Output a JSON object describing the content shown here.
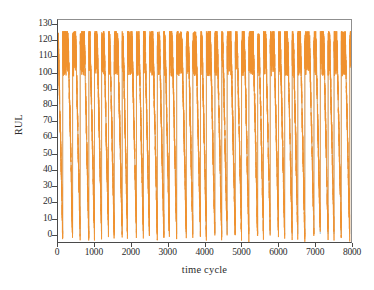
{
  "chart_data": {
    "type": "line",
    "title": "",
    "xlabel": "time cycle",
    "ylabel": "RUL",
    "xlim": [
      0,
      8000
    ],
    "ylim": [
      -5,
      133
    ],
    "xticks": [
      0,
      1000,
      2000,
      3000,
      4000,
      5000,
      6000,
      7000,
      8000
    ],
    "xtick_labels": [
      "0",
      "1000",
      "2000",
      "3000",
      "4000",
      "5000",
      "6000",
      "7000",
      "8000"
    ],
    "yticks": [
      0,
      10,
      20,
      30,
      40,
      50,
      60,
      70,
      80,
      90,
      100,
      110,
      120,
      130
    ],
    "ytick_labels": [
      "0",
      "10",
      "20",
      "30",
      "40",
      "50",
      "60",
      "70",
      "80",
      "90",
      "100",
      "110",
      "120",
      "130"
    ],
    "grid": false,
    "legend": "none",
    "series": [
      {
        "name": "true RUL",
        "color": "#aecde3",
        "linewidth": 0.9,
        "description": "Piecewise-linear ground-truth RUL: clipped at a ceiling of 120 then ramping linearly down to 0 at each engine end-of-life, repeating as a sawtooth across 8000 time cycles.",
        "cap_value": 120,
        "floor_value": 0,
        "cycle_count": 100,
        "segment_lengths": [
          128,
          269,
          206,
          235,
          154,
          193,
          188,
          156,
          216,
          144,
          243,
          189,
          164,
          214,
          178,
          150,
          197,
          263,
          176,
          208,
          160,
          232,
          185,
          147,
          221,
          170,
          199,
          239,
          158,
          183,
          226,
          167,
          204,
          152,
          191,
          248,
          173,
          212,
          161,
          196,
          230,
          149,
          187,
          218,
          165,
          202,
          256,
          179,
          223,
          155,
          194,
          237,
          171,
          209,
          163,
          190,
          244,
          176,
          215,
          151,
          198,
          228,
          168,
          205,
          159,
          186,
          251,
          174,
          220,
          157,
          192,
          234,
          169,
          207,
          162,
          189,
          241,
          177,
          217,
          153,
          195,
          225,
          166,
          203,
          181,
          213,
          246,
          172,
          200,
          148,
          210,
          233,
          180,
          222,
          164,
          201,
          229,
          175,
          211,
          183
        ]
      },
      {
        "name": "predicted RUL",
        "color": "#f0912f",
        "linewidth": 0.85,
        "description": "Model-predicted RUL: follows the same sawtooth envelope but with additive noise, overshooting above 120 to roughly 126 at peaks and undershooting below 0 to roughly -5 at troughs.",
        "peak_overshoot": 126,
        "trough_undershoot": -5,
        "noise_amplitude": 8
      }
    ]
  },
  "axes": {
    "frame_color": "#4a4a4a"
  }
}
